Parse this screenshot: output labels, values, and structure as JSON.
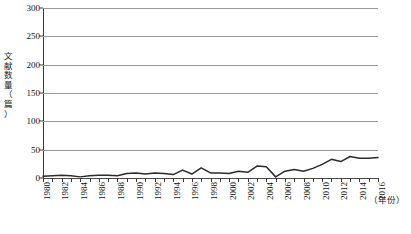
{
  "chart_data": {
    "type": "line",
    "title": "",
    "xlabel": "（年份）",
    "ylabel": "文献数量（篇）",
    "ylim": [
      0,
      300
    ],
    "xlim": [
      1980,
      2016
    ],
    "yticks": [
      0,
      50,
      100,
      150,
      200,
      250,
      300
    ],
    "xticks_labeled": [
      1980,
      1982,
      1984,
      1986,
      1988,
      1990,
      1992,
      1994,
      1996,
      1998,
      2000,
      2002,
      2004,
      2006,
      2008,
      2010,
      2012,
      2014,
      2016
    ],
    "grid": "horizontal",
    "legend": "none",
    "line_color": "#2b2b2b",
    "grid_color": "#9a9a9a",
    "x": [
      1980,
      1981,
      1982,
      1983,
      1984,
      1985,
      1986,
      1987,
      1988,
      1989,
      1990,
      1991,
      1992,
      1993,
      1994,
      1995,
      1996,
      1997,
      1998,
      1999,
      2000,
      2001,
      2002,
      2003,
      2004,
      2005,
      2006,
      2007,
      2008,
      2009,
      2010,
      2011,
      2012,
      2013,
      2014,
      2015,
      2016
    ],
    "values": [
      3,
      4,
      5,
      4,
      2,
      4,
      5,
      5,
      4,
      8,
      9,
      7,
      9,
      8,
      6,
      14,
      7,
      18,
      9,
      9,
      8,
      12,
      10,
      21,
      20,
      2,
      12,
      15,
      12,
      17,
      24,
      33,
      29,
      38,
      35,
      35,
      36
    ]
  },
  "yaxis": {
    "title_chars": "文\n献\n数\n量\n（\n篇\n）",
    "ticks": [
      "300",
      "250",
      "200",
      "150",
      "100",
      "50",
      "0"
    ]
  },
  "xaxis": {
    "title": "（年份）",
    "labels": [
      "1980",
      "1982",
      "1984",
      "1986",
      "1988",
      "1990",
      "1992",
      "1994",
      "1996",
      "1998",
      "2000",
      "2002",
      "2004",
      "2006",
      "2008",
      "2010",
      "2012",
      "2014",
      "2016"
    ]
  },
  "caption": ""
}
